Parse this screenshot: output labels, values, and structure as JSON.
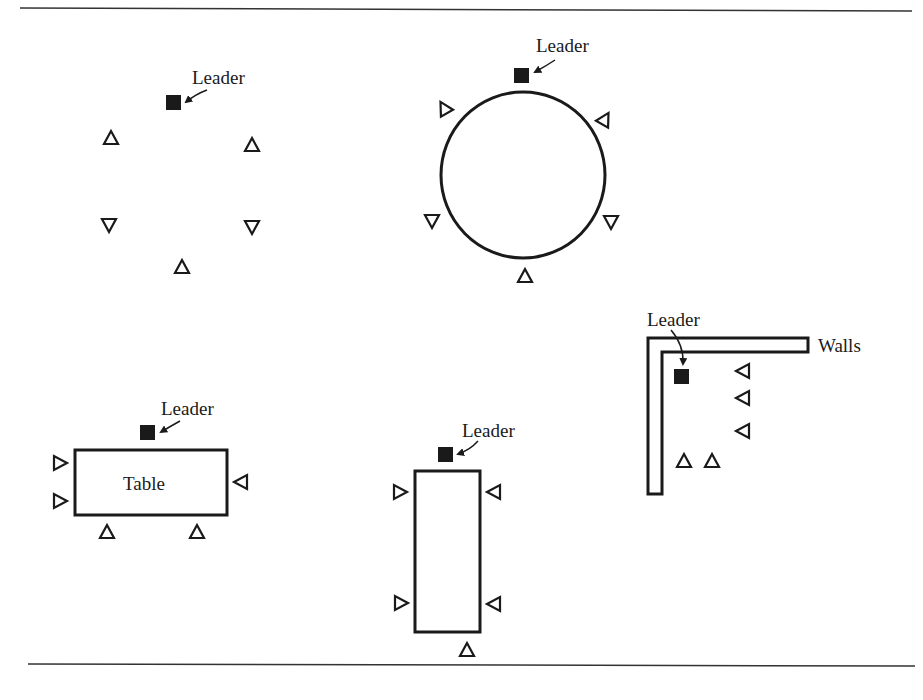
{
  "figure": {
    "labels": {
      "leader": "Leader",
      "table": "Table",
      "walls": "Walls"
    },
    "colors": {
      "ink": "#1a1a1a",
      "background": "#ffffff"
    },
    "arrangements": [
      {
        "name": "open-circle",
        "leader_count": 1,
        "member_count": 5
      },
      {
        "name": "circle-around-object",
        "leader_count": 1,
        "member_count": 5
      },
      {
        "name": "horizontal-table",
        "leader_count": 1,
        "member_count": 5
      },
      {
        "name": "vertical-table",
        "leader_count": 1,
        "member_count": 5
      },
      {
        "name": "corner-walls",
        "leader_count": 1,
        "member_count": 5
      }
    ]
  }
}
